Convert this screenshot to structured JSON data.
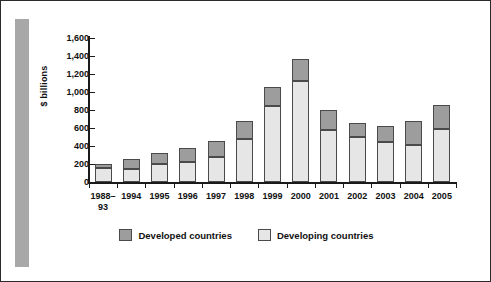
{
  "chart_data": {
    "type": "bar",
    "stacked": true,
    "title": "",
    "subtitle": "",
    "xlabel": "",
    "ylabel": "$ billions",
    "ylim": [
      0,
      1600
    ],
    "yticks": [
      "0",
      "200",
      "400",
      "600",
      "800",
      "1,000",
      "1,200",
      "1,400",
      "1,600"
    ],
    "ytick_values": [
      0,
      200,
      400,
      600,
      800,
      1000,
      1200,
      1400,
      1600
    ],
    "grid": false,
    "legend_position": "bottom-center",
    "categories": [
      "1988–\n93",
      "1994",
      "1995",
      "1996",
      "1997",
      "1998",
      "1999",
      "2000",
      "2001",
      "2002",
      "2003",
      "2004",
      "2005"
    ],
    "series": [
      {
        "name": "Developing countries",
        "color": "#e6e6e6",
        "values": [
          160,
          150,
          200,
          225,
          275,
          475,
          840,
          1120,
          575,
          495,
          440,
          410,
          590
        ]
      },
      {
        "name": "Developed countries",
        "color": "#9d9d9d",
        "values": [
          45,
          105,
          120,
          150,
          180,
          205,
          220,
          250,
          225,
          160,
          185,
          265,
          270
        ]
      }
    ],
    "totals": [
      205,
      255,
      320,
      375,
      455,
      680,
      1060,
      1370,
      800,
      655,
      625,
      675,
      860
    ]
  },
  "legend": {
    "items": [
      {
        "label": "Developed countries",
        "color": "#9d9d9d"
      },
      {
        "label": "Developing countries",
        "color": "#e6e6e6"
      }
    ]
  },
  "colors": {
    "developed": "#9d9d9d",
    "developing": "#e6e6e6",
    "axis": "#1a1a1a",
    "frame": "#2b2b2b",
    "left_band": "#a8a8a8"
  }
}
